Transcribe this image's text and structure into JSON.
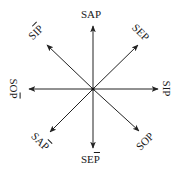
{
  "diagram": {
    "center": {
      "x": 93,
      "y": 89
    },
    "stroke_color": "#222222",
    "labels": {
      "n": {
        "text": "SAP",
        "overline_last": false
      },
      "ne": {
        "text": "SEP",
        "overline_last": false
      },
      "e": {
        "text": "SIP",
        "overline_last": false
      },
      "se": {
        "text": "SOP",
        "overline_last": false
      },
      "s": {
        "prefix": "SE",
        "last": "P",
        "overline_last": true
      },
      "sw": {
        "prefix": "SA",
        "last": "P",
        "overline_last": true
      },
      "w": {
        "prefix": "SO",
        "last": "P",
        "overline_last": true
      },
      "nw": {
        "prefix": "SI",
        "last": "P",
        "overline_last": true
      }
    },
    "arrows": [
      {
        "dir": "n",
        "x2": 93,
        "y2": 26
      },
      {
        "dir": "ne",
        "x2": 138,
        "y2": 45
      },
      {
        "dir": "e",
        "x2": 158,
        "y2": 89
      },
      {
        "dir": "se",
        "x2": 139,
        "y2": 131
      },
      {
        "dir": "s",
        "x2": 93,
        "y2": 148
      },
      {
        "dir": "sw",
        "x2": 50,
        "y2": 132
      },
      {
        "dir": "w",
        "x2": 29,
        "y2": 89
      },
      {
        "dir": "nw",
        "x2": 47,
        "y2": 45
      }
    ]
  }
}
